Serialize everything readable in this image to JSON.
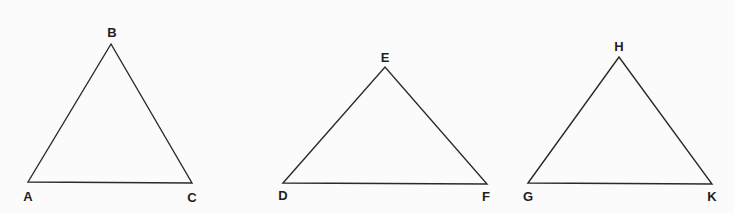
{
  "diagram": {
    "background": "#fbfbfb",
    "stroke_color": "#2a2a2a",
    "triangles": [
      {
        "name": "triangle-abc",
        "vertices": [
          {
            "label": "A",
            "x": 28,
            "y": 182,
            "lx": 28,
            "ly": 201
          },
          {
            "label": "B",
            "x": 111,
            "y": 44,
            "lx": 112,
            "ly": 37
          },
          {
            "label": "C",
            "x": 192,
            "y": 183,
            "lx": 192,
            "ly": 202
          }
        ]
      },
      {
        "name": "triangle-def",
        "vertices": [
          {
            "label": "D",
            "x": 283,
            "y": 183,
            "lx": 283,
            "ly": 200
          },
          {
            "label": "E",
            "x": 385,
            "y": 67,
            "lx": 385,
            "ly": 62
          },
          {
            "label": "F",
            "x": 487,
            "y": 184,
            "lx": 486,
            "ly": 201
          }
        ]
      },
      {
        "name": "triangle-ghk",
        "vertices": [
          {
            "label": "G",
            "x": 528,
            "y": 183,
            "lx": 528,
            "ly": 201
          },
          {
            "label": "H",
            "x": 619,
            "y": 57,
            "lx": 619,
            "ly": 51
          },
          {
            "label": "K",
            "x": 712,
            "y": 184,
            "lx": 712,
            "ly": 201
          }
        ]
      }
    ]
  }
}
